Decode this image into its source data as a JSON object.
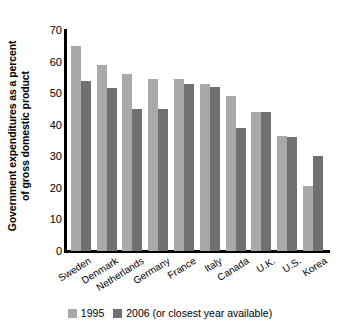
{
  "chart_data": {
    "type": "bar",
    "title": "",
    "subtitle": "",
    "xlabel": "",
    "ylabel": "Government expenditures as a percent of gross domestic product",
    "ylabel_lines": [
      "Government expenditures as a percent",
      "of gross domestic product"
    ],
    "ylim": [
      0,
      70
    ],
    "yticks": [
      70,
      60,
      50,
      40,
      30,
      20,
      10,
      0
    ],
    "ytick_labels": [
      "70",
      "60",
      "50",
      "40",
      "30",
      "20",
      "10",
      "0"
    ],
    "grid": false,
    "legend_position": "bottom-center",
    "categories": [
      "Sweden",
      "Denmark",
      "Netherlands",
      "Germany",
      "France",
      "Italy",
      "Canada",
      "U.K.",
      "U.S.",
      "Korea"
    ],
    "series": [
      {
        "name": "1995",
        "color": "#a9a9a9",
        "values": [
          65,
          59,
          56,
          54.5,
          54.5,
          53,
          49,
          44,
          36.5,
          20.5
        ]
      },
      {
        "name": "2006 (or closest year available)",
        "color": "#707070",
        "values": [
          54,
          51.5,
          45,
          45,
          53,
          52,
          39,
          44,
          36,
          30
        ]
      }
    ]
  },
  "legend": {
    "items": [
      {
        "label": "1995",
        "color": "#a9a9a9"
      },
      {
        "label": "2006 (or closest year available)",
        "color": "#707070"
      }
    ]
  },
  "colors": {
    "series_1995": "#a9a9a9",
    "series_2006": "#707070",
    "axis": "#000000",
    "background": "#ffffff"
  }
}
